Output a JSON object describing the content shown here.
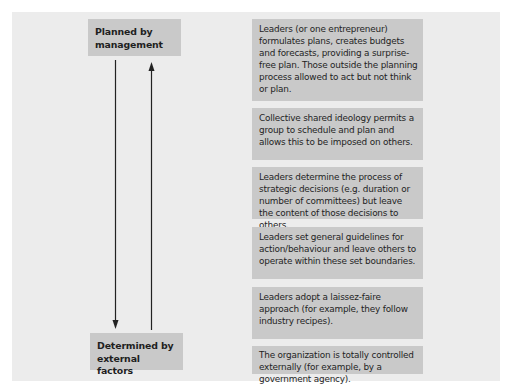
{
  "diagram": {
    "top_label": "Planned by management",
    "bottom_label": "Determined by external factors",
    "descriptions": [
      "Leaders (or one entrepreneur) formulates plans, creates budgets and forecasts, providing a surprise-free plan. Those outside the planning process allowed to act but not think or plan.",
      "Collective shared ideology permits a group to schedule and plan and allows this to be imposed on others.",
      "Leaders determine the process of strategic decisions (e.g. duration or number of committees) but leave the content of those decisions to others.",
      "Leaders set general guidelines for action/behaviour and leave others to operate within these set boundaries.",
      "Leaders adopt a laissez-faire approach (for example, they follow industry recipes).",
      "The organization is totally controlled externally (for example, by a government agency)."
    ],
    "arrows": [
      {
        "from": "Planned by management",
        "to": "Determined by external factors",
        "direction": "down"
      },
      {
        "from": "Determined by external factors",
        "to": "Planned by management",
        "direction": "up"
      }
    ],
    "colors": {
      "panel": "#ececec",
      "box": "#c9c9c9",
      "text": "#1f1f1f",
      "arrow": "#222222"
    }
  }
}
